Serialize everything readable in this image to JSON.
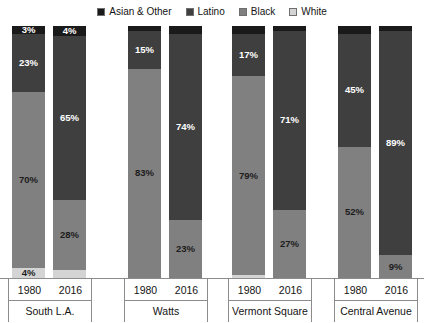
{
  "legend": {
    "items": [
      {
        "label": "Asian & Other",
        "color": "#1a1a1a"
      },
      {
        "label": "Latino",
        "color": "#3f3f3f"
      },
      {
        "label": "Black",
        "color": "#808080"
      },
      {
        "label": "White",
        "color": "#d4d4d4"
      }
    ]
  },
  "chart_data": {
    "type": "bar",
    "title": "",
    "subtitle": "",
    "xlabel": "",
    "ylabel": "",
    "stacked": true,
    "stack_total": 100,
    "ylim": [
      0,
      100
    ],
    "grid": false,
    "legend_position": "top-center",
    "legend_entries": [
      "Asian & Other",
      "Latino",
      "Black",
      "White"
    ],
    "series_colors": {
      "Asian & Other": "#1a1a1a",
      "Latino": "#3f3f3f",
      "Black": "#808080",
      "White": "#d4d4d4"
    },
    "groups": [
      {
        "name": "South L.A.",
        "bars": [
          {
            "year": "1980",
            "segments": [
              {
                "series": "Asian & Other",
                "value": 3,
                "label": "3%",
                "label_shown": true,
                "label_color": "light"
              },
              {
                "series": "Latino",
                "value": 23,
                "label": "23%",
                "label_shown": true,
                "label_color": "light"
              },
              {
                "series": "Black",
                "value": 70,
                "label": "70%",
                "label_shown": true,
                "label_color": "dark"
              },
              {
                "series": "White",
                "value": 4,
                "label": "4%",
                "label_shown": true,
                "label_color": "dark"
              }
            ]
          },
          {
            "year": "2016",
            "segments": [
              {
                "series": "Asian & Other",
                "value": 4,
                "label": "4%",
                "label_shown": true,
                "label_color": "light"
              },
              {
                "series": "Latino",
                "value": 65,
                "label": "65%",
                "label_shown": true,
                "label_color": "light"
              },
              {
                "series": "Black",
                "value": 28,
                "label": "28%",
                "label_shown": true,
                "label_color": "dark"
              },
              {
                "series": "White",
                "value": 3,
                "label": "",
                "label_shown": false,
                "label_color": "dark"
              }
            ]
          }
        ]
      },
      {
        "name": "Watts",
        "bars": [
          {
            "year": "1980",
            "segments": [
              {
                "series": "Asian & Other",
                "value": 2,
                "label": "",
                "label_shown": false,
                "label_color": "light"
              },
              {
                "series": "Latino",
                "value": 15,
                "label": "15%",
                "label_shown": true,
                "label_color": "light"
              },
              {
                "series": "Black",
                "value": 83,
                "label": "83%",
                "label_shown": true,
                "label_color": "dark"
              },
              {
                "series": "White",
                "value": 0,
                "label": "",
                "label_shown": false,
                "label_color": "dark"
              }
            ]
          },
          {
            "year": "2016",
            "segments": [
              {
                "series": "Asian & Other",
                "value": 3,
                "label": "",
                "label_shown": false,
                "label_color": "light"
              },
              {
                "series": "Latino",
                "value": 74,
                "label": "74%",
                "label_shown": true,
                "label_color": "light"
              },
              {
                "series": "Black",
                "value": 23,
                "label": "23%",
                "label_shown": true,
                "label_color": "dark"
              },
              {
                "series": "White",
                "value": 0,
                "label": "",
                "label_shown": false,
                "label_color": "dark"
              }
            ]
          }
        ]
      },
      {
        "name": "Vermont Square",
        "bars": [
          {
            "year": "1980",
            "segments": [
              {
                "series": "Asian & Other",
                "value": 3,
                "label": "",
                "label_shown": false,
                "label_color": "light"
              },
              {
                "series": "Latino",
                "value": 17,
                "label": "17%",
                "label_shown": true,
                "label_color": "light"
              },
              {
                "series": "Black",
                "value": 79,
                "label": "79%",
                "label_shown": true,
                "label_color": "dark"
              },
              {
                "series": "White",
                "value": 1,
                "label": "",
                "label_shown": false,
                "label_color": "dark"
              }
            ]
          },
          {
            "year": "2016",
            "segments": [
              {
                "series": "Asian & Other",
                "value": 2,
                "label": "",
                "label_shown": false,
                "label_color": "light"
              },
              {
                "series": "Latino",
                "value": 71,
                "label": "71%",
                "label_shown": true,
                "label_color": "light"
              },
              {
                "series": "Black",
                "value": 27,
                "label": "27%",
                "label_shown": true,
                "label_color": "dark"
              },
              {
                "series": "White",
                "value": 0,
                "label": "",
                "label_shown": false,
                "label_color": "dark"
              }
            ]
          }
        ]
      },
      {
        "name": "Central Avenue",
        "bars": [
          {
            "year": "1980",
            "segments": [
              {
                "series": "Asian & Other",
                "value": 3,
                "label": "",
                "label_shown": false,
                "label_color": "light"
              },
              {
                "series": "Latino",
                "value": 45,
                "label": "45%",
                "label_shown": true,
                "label_color": "light"
              },
              {
                "series": "Black",
                "value": 52,
                "label": "52%",
                "label_shown": true,
                "label_color": "dark"
              },
              {
                "series": "White",
                "value": 0,
                "label": "",
                "label_shown": false,
                "label_color": "dark"
              }
            ]
          },
          {
            "year": "2016",
            "segments": [
              {
                "series": "Asian & Other",
                "value": 2,
                "label": "",
                "label_shown": false,
                "label_color": "light"
              },
              {
                "series": "Latino",
                "value": 89,
                "label": "89%",
                "label_shown": true,
                "label_color": "light"
              },
              {
                "series": "Black",
                "value": 9,
                "label": "9%",
                "label_shown": true,
                "label_color": "dark"
              },
              {
                "series": "White",
                "value": 0,
                "label": "",
                "label_shown": false,
                "label_color": "dark"
              }
            ]
          }
        ]
      }
    ]
  },
  "layout": {
    "group_x": [
      8,
      124,
      228,
      334
    ],
    "group_width": [
      84,
      84,
      84,
      84
    ],
    "bar_offsets": [
      4,
      45
    ],
    "bar_width": 33,
    "plot_height": 252
  }
}
